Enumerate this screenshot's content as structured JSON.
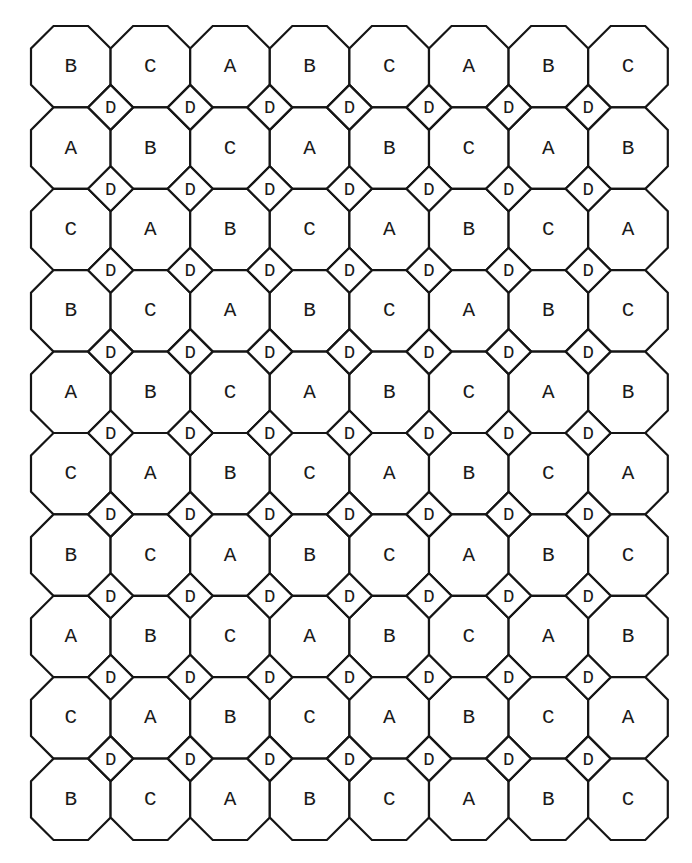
{
  "diagram": {
    "type": "truncated-square-tiling",
    "columns": 8,
    "rows": 10,
    "octagon_labels": [
      [
        "B",
        "C",
        "A",
        "B",
        "C",
        "A",
        "B",
        "C"
      ],
      [
        "A",
        "B",
        "C",
        "A",
        "B",
        "C",
        "A",
        "B"
      ],
      [
        "C",
        "A",
        "B",
        "C",
        "A",
        "B",
        "C",
        "A"
      ],
      [
        "B",
        "C",
        "A",
        "B",
        "C",
        "A",
        "B",
        "C"
      ],
      [
        "A",
        "B",
        "C",
        "A",
        "B",
        "C",
        "A",
        "B"
      ],
      [
        "C",
        "A",
        "B",
        "C",
        "A",
        "B",
        "C",
        "A"
      ],
      [
        "B",
        "C",
        "A",
        "B",
        "C",
        "A",
        "B",
        "C"
      ],
      [
        "A",
        "B",
        "C",
        "A",
        "B",
        "C",
        "A",
        "B"
      ],
      [
        "C",
        "A",
        "B",
        "C",
        "A",
        "B",
        "C",
        "A"
      ],
      [
        "B",
        "C",
        "A",
        "B",
        "C",
        "A",
        "B",
        "C"
      ]
    ],
    "square_label": "D",
    "square_grid": {
      "rows": 9,
      "columns": 7
    },
    "colors": {
      "stroke": "#151515",
      "fill": "#ffffff",
      "text": "#1a1a1a"
    }
  },
  "geometry": {
    "origin_x": 31,
    "origin_y": 26,
    "cell_width": 79.6,
    "cell_height": 81.4,
    "chamfer": 22.5
  }
}
